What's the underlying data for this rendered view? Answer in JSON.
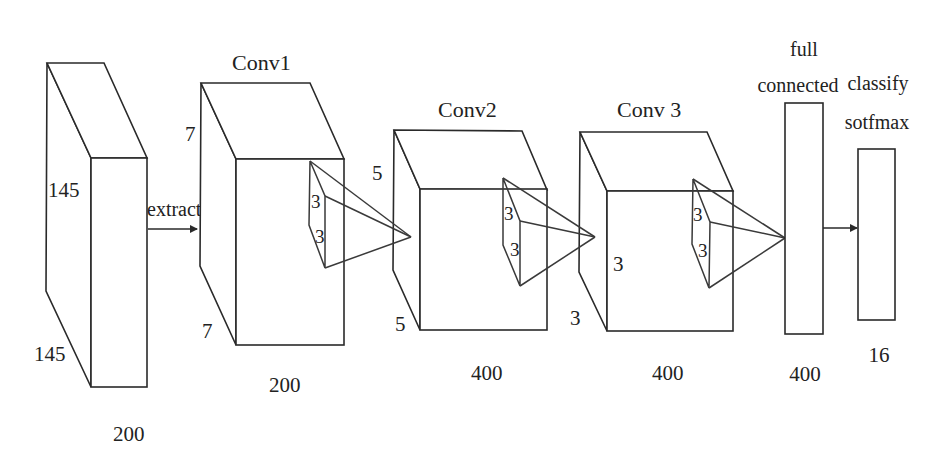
{
  "diagram": {
    "type": "cnn-architecture",
    "input": {
      "height_label": "145",
      "depth_label": "145",
      "width_label": "200",
      "arrow_label": "extract"
    },
    "conv1": {
      "title": "Conv1",
      "top_label": "7",
      "bottom_label": "7",
      "kernel_label_a": "3",
      "kernel_label_b": "3",
      "width_label": "200"
    },
    "conv2": {
      "title": "Conv2",
      "top_label": "5",
      "bottom_label": "5",
      "kernel_label_a": "3",
      "kernel_label_b": "3",
      "width_label": "400"
    },
    "conv3": {
      "title": "Conv 3",
      "side_label": "3",
      "bottom_label": "3",
      "kernel_label_a": "3",
      "kernel_label_b": "3",
      "width_label": "400"
    },
    "fc": {
      "title_line1": "full",
      "title_line2": "connected",
      "size_label": "400"
    },
    "softmax": {
      "title_line1": "classify",
      "title_line2": "sotfmax",
      "size_label": "16"
    }
  },
  "colors": {
    "stroke": "#2a2a2a",
    "background": "#ffffff"
  }
}
